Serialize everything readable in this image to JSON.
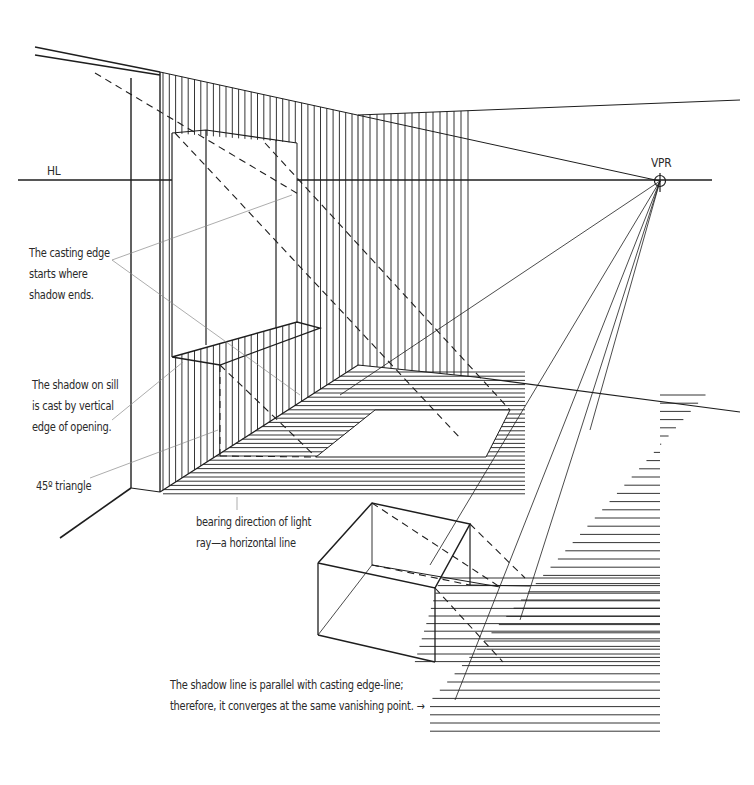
{
  "diagram": {
    "type": "perspective shadow construction",
    "horizon_label": "HL",
    "vanishing_point_label": "VPR",
    "colors": {
      "ink": "#1e1e1e",
      "leader": "#8a8a8a",
      "background": "#ffffff"
    }
  },
  "annotations": {
    "casting_edge": {
      "lines": [
        "The casting edge",
        "starts where",
        "shadow ends."
      ]
    },
    "sill_shadow": {
      "lines": [
        "The shadow on sill",
        "is cast by vertical",
        "edge of opening."
      ]
    },
    "triangle": {
      "lines": [
        "45º triangle"
      ]
    },
    "bearing": {
      "lines": [
        "bearing direction of light",
        "ray—a horizontal line"
      ]
    },
    "shadow_line": {
      "lines": [
        "The shadow line is parallel with casting edge-line;",
        "therefore, it converges at the same vanishing point.  →"
      ]
    }
  }
}
